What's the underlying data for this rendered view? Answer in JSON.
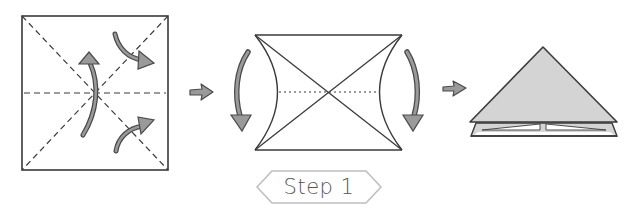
{
  "step": {
    "label": "Step 1",
    "number": 1
  },
  "figures": [
    {
      "id": "square-with-creases",
      "description": "Square sheet with dashed diagonal and horizontal crease lines and three curved fold arrows"
    },
    {
      "id": "collapsing-square",
      "description": "Square folding with concave sides, solid diagonals, dotted midline, and two downward curved arrows on the sides"
    },
    {
      "id": "waterbomb-base",
      "description": "Resulting shaded triangle (waterbomb base) with layered bottom edges"
    }
  ],
  "arrows": [
    {
      "id": "arrow-1-to-2",
      "icon": "right-arrow-icon"
    },
    {
      "id": "arrow-2-to-3",
      "icon": "right-arrow-icon"
    }
  ],
  "colors": {
    "line": "#3a3a3a",
    "arrow_fill": "#9a9a9a",
    "arrow_stroke": "#4a4a4a",
    "triangle_fill": "#d4d4d4",
    "label_border": "#bdbdbd",
    "label_text": "#555555",
    "background": "#ffffff"
  }
}
